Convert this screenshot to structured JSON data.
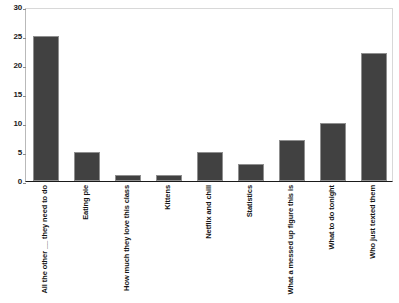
{
  "chart_data": {
    "type": "bar",
    "title": "",
    "subtitle": "",
    "xlabel": "",
    "ylabel": "",
    "ylim": [
      0,
      30
    ],
    "yticks": [
      0,
      5,
      10,
      15,
      20,
      25,
      30
    ],
    "grid": false,
    "legend": false,
    "legend_position": "none",
    "bar_color": "#414141",
    "bar_edge_color": "#8f8f8f",
    "axis_color": "#1a1a1a",
    "background_color": "#ffffff",
    "categories": [
      "All the other __ they need to do",
      "Eating pie",
      "How much they love this class",
      "Kittens",
      "Netflix and chill",
      "Statistics",
      "What a messed up figure this is",
      "What to do tonight",
      "Who just texted them"
    ],
    "values": [
      25,
      5,
      1,
      1,
      5,
      3,
      7,
      10,
      22
    ]
  }
}
